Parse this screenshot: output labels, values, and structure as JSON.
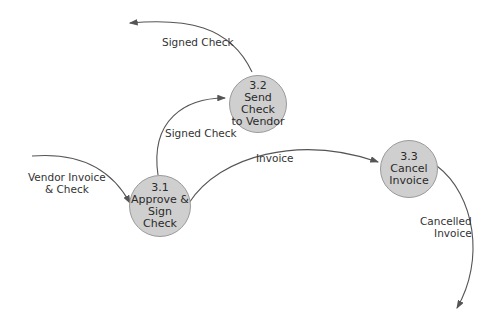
{
  "nodes": [
    {
      "id": "3.1",
      "number": "3.1",
      "lines": [
        "Approve &",
        "Sign",
        "Check"
      ]
    },
    {
      "id": "3.2",
      "number": "3.2",
      "lines": [
        "Send Check",
        "to Vendor"
      ]
    },
    {
      "id": "3.3",
      "number": "3.3",
      "lines": [
        "Cancel",
        "Invoice"
      ]
    }
  ],
  "flows": {
    "vendor_invoice": [
      "Vendor Invoice",
      "& Check"
    ],
    "signed_check_to_32": "Signed Check",
    "signed_check_out": "Signed Check",
    "invoice": "Invoice",
    "cancelled_invoice": [
      "Cancelled",
      "Invoice"
    ]
  },
  "colors": {
    "node_fill": "#cfcfcf",
    "line": "#555555"
  }
}
